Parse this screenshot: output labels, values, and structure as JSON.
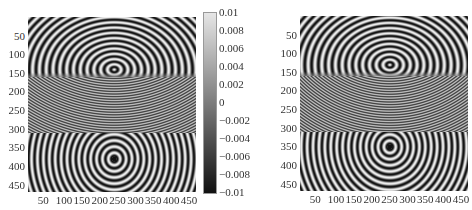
{
  "chart_data": [
    {
      "type": "heatmap",
      "title": "",
      "description": "Wavefield snapshot, three-layer model (upper, middle fine-striped layer, lower); point source at ~(240,380) with reflected hyperbolic arcs in upper layer",
      "xlabel": "",
      "ylabel": "",
      "x_ticks": [
        "50",
        "100",
        "150",
        "200",
        "250",
        "300",
        "350",
        "400",
        "450"
      ],
      "y_ticks": [
        "50",
        "100",
        "150",
        "200",
        "250",
        "300",
        "350",
        "400",
        "450"
      ],
      "xlim": [
        0,
        470
      ],
      "ylim": [
        470,
        0
      ],
      "layer_boundaries_y": [
        160,
        310
      ],
      "source": {
        "x": 240,
        "y": 380
      },
      "colormap": "gray",
      "colorbar": {
        "ticks": [
          "0.01",
          "0.008",
          "0.006",
          "0.004",
          "0.002",
          "0",
          "-0.002",
          "-0.004",
          "-0.006",
          "-0.008",
          "-0.01"
        ],
        "range": [
          -0.01,
          0.01
        ]
      }
    },
    {
      "type": "heatmap",
      "title": "",
      "description": "Wavefield snapshot, same model, source at ~(250,350)",
      "xlabel": "",
      "ylabel": "",
      "x_ticks": [
        "50",
        "100",
        "150",
        "200",
        "250",
        "300",
        "350",
        "400",
        "450"
      ],
      "y_ticks": [
        "50",
        "100",
        "150",
        "200",
        "250",
        "300",
        "350",
        "400",
        "450"
      ],
      "xlim": [
        0,
        470
      ],
      "ylim": [
        470,
        0
      ],
      "layer_boundaries_y": [
        160,
        310
      ],
      "source": {
        "x": 250,
        "y": 350
      },
      "colormap": "gray"
    }
  ],
  "plots": [
    {
      "left": 28,
      "top": 17,
      "width": 168,
      "height": 175,
      "src_x": 240,
      "src_y": 380,
      "upper_focus_y": 140
    },
    {
      "left": 300,
      "top": 16,
      "width": 168,
      "height": 175,
      "src_x": 250,
      "src_y": 350,
      "upper_focus_y": 130
    }
  ]
}
